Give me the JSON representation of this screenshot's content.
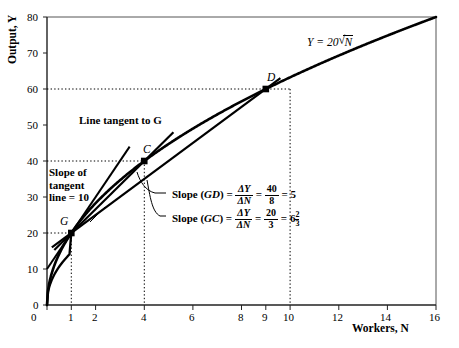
{
  "chart_data": {
    "type": "line",
    "title": "",
    "xlabel": "Workers, N",
    "ylabel": "Output, Y",
    "xlim": [
      0,
      16
    ],
    "ylim": [
      0,
      80
    ],
    "xticks": [
      0,
      1,
      2,
      4,
      6,
      8,
      9,
      10,
      12,
      14,
      16
    ],
    "yticks": [
      0,
      10,
      20,
      30,
      40,
      50,
      60,
      70,
      80
    ],
    "grid": false,
    "equation_label": "Y = 20",
    "equation_radicand": "N",
    "series": [
      {
        "name": "production-function",
        "kind": "curve",
        "formula": "Y = 20*sqrt(N)",
        "x": [
          0,
          0.25,
          0.5,
          1,
          2,
          3,
          4,
          5,
          6,
          7,
          8,
          9,
          10,
          11,
          12,
          13,
          14,
          15,
          16
        ],
        "y": [
          0,
          10,
          14.14,
          20,
          28.28,
          34.64,
          40,
          44.72,
          48.99,
          52.92,
          56.57,
          60,
          63.25,
          66.33,
          69.28,
          72.11,
          74.83,
          77.46,
          80
        ]
      },
      {
        "name": "tangent-line-at-G",
        "kind": "line",
        "slope": 10,
        "x": [
          0,
          3.4
        ],
        "y": [
          10,
          44
        ]
      },
      {
        "name": "chord-GD",
        "kind": "line",
        "slope": 5,
        "x": [
          0.2,
          9.6
        ],
        "y": [
          16,
          63
        ]
      },
      {
        "name": "chord-GC",
        "kind": "line",
        "slope": 6.6667,
        "x": [
          0.3,
          5.2
        ],
        "y": [
          15.3,
          48
        ]
      }
    ],
    "points": [
      {
        "label": "G",
        "x": 1,
        "y": 20
      },
      {
        "label": "C",
        "x": 4,
        "y": 40
      },
      {
        "label": "D",
        "x": 9,
        "y": 60
      }
    ],
    "guide_lines": [
      {
        "type": "horizontal",
        "y": 20,
        "from_x": 0,
        "to_x": 1
      },
      {
        "type": "horizontal",
        "y": 40,
        "from_x": 0,
        "to_x": 4
      },
      {
        "type": "horizontal",
        "y": 60,
        "from_x": 0,
        "to_x": 9
      },
      {
        "type": "vertical",
        "x": 1,
        "from_y": 0,
        "to_y": 20
      },
      {
        "type": "vertical",
        "x": 4,
        "from_y": 0,
        "to_y": 40
      },
      {
        "type": "vertical",
        "x": 9,
        "from_y": 0,
        "to_y": 60
      }
    ],
    "annotations": {
      "tangent_label": "Line tangent to G",
      "slope_tangent_line1": "Slope of",
      "slope_tangent_line2": "tangent",
      "slope_tangent_line3": "line = 10",
      "slope_gd": {
        "prefix": "Slope (",
        "pair": "GD",
        "suffix": ") =",
        "ratio_num": "ΔY",
        "ratio_den": "ΔN",
        "eq1": "=",
        "frac_num": "40",
        "frac_den": "8",
        "eq2": "=",
        "result": "5"
      },
      "slope_gc": {
        "prefix": "Slope (",
        "pair": "GC",
        "suffix": ") =",
        "ratio_num": "ΔY",
        "ratio_den": "ΔN",
        "eq1": "=",
        "frac_num": "20",
        "frac_den": "3",
        "eq2": "=",
        "result": "6",
        "mixed_num": "2",
        "mixed_den": "3"
      }
    }
  },
  "colors": {
    "ink": "#000000",
    "background": "#ffffff",
    "frame": "#333333"
  }
}
